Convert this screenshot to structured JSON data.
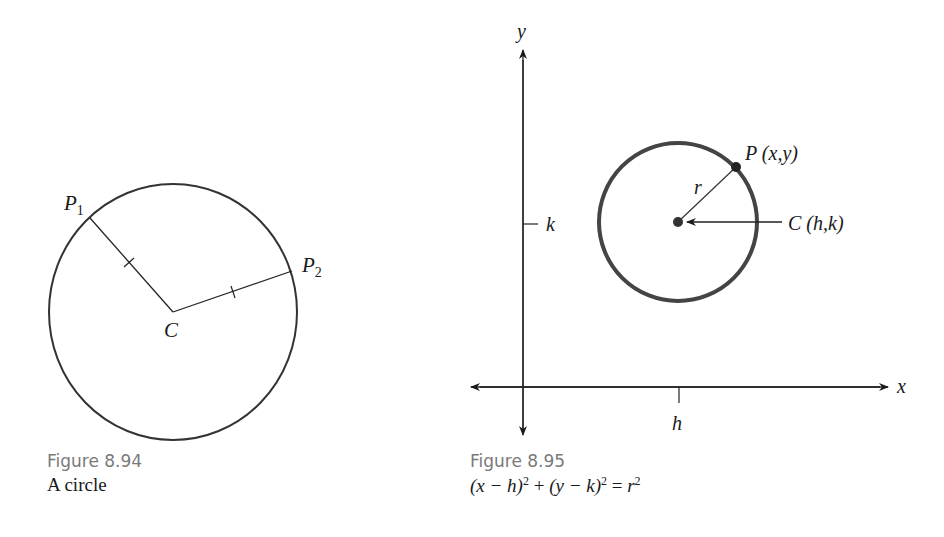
{
  "figures": [
    {
      "id": "8.94",
      "caption_title": "Figure 8.94",
      "caption_text": "A circle",
      "labels": {
        "center": "C",
        "point1": "P",
        "point1_sub": "1",
        "point2": "P",
        "point2_sub": "2"
      }
    },
    {
      "id": "8.95",
      "caption_title": "Figure 8.95",
      "caption_equation": {
        "part1": "(x − h)",
        "exp1": "2",
        "plus": " + ",
        "part2": "(y − k)",
        "exp2": "2",
        "equals": " = ",
        "part3": "r",
        "exp3": "2"
      },
      "labels": {
        "y_axis": "y",
        "x_axis": "x",
        "k_tick": "k",
        "h_tick": "h",
        "radius": "r",
        "point": "P (x,y)",
        "center": "C (h,k)"
      }
    }
  ],
  "colors": {
    "ink": "#1a1a1a",
    "thick_circle": "#444444",
    "caption_gray": "#7a7a7a"
  }
}
